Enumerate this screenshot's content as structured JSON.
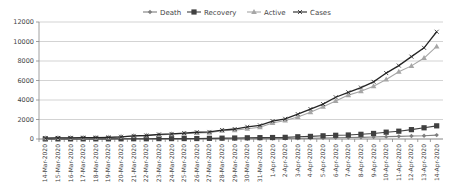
{
  "chart_data": {
    "type": "line",
    "title": "",
    "xlabel": "",
    "ylabel": "",
    "ylim": [
      0,
      12000
    ],
    "yticks": [
      0,
      2000,
      4000,
      6000,
      8000,
      10000,
      12000
    ],
    "grid": true,
    "legend_position": "top",
    "categories": [
      "14-Mar-2020",
      "15-Mar-2020",
      "16-Mar-2020",
      "17-Mar-2020",
      "18-Mar-2020",
      "19-Mar-2020",
      "20-Mar-2020",
      "21-Mar-2020",
      "22-Mar-2020",
      "23-Mar-2020",
      "24-Mar-2020",
      "25-Mar-2020",
      "26-Mar-2020",
      "27-Mar-2020",
      "28-Mar-2020",
      "29-Mar-2020",
      "30-Mar-2020",
      "31-Mar-2020",
      "1-Apr-2020",
      "2-Apr-2020",
      "3-Apr-2020",
      "4-Apr-2020",
      "5-Apr-2020",
      "6-Apr-2020",
      "7-Apr-2020",
      "8-Apr-2020",
      "9-Apr-2020",
      "10-Apr-2020",
      "11-Apr-2020",
      "12-Apr-2020",
      "13-Apr-2020",
      "14-Apr-2020"
    ],
    "series": [
      {
        "name": "Death",
        "color": "#7f7f7f",
        "marker": "diamond",
        "values": [
          2,
          2,
          2,
          3,
          3,
          4,
          4,
          7,
          7,
          10,
          10,
          13,
          17,
          20,
          25,
          27,
          32,
          35,
          41,
          56,
          75,
          83,
          109,
          124,
          149,
          169,
          199,
          239,
          273,
          308,
          339,
          400
        ]
      },
      {
        "name": "Recovery",
        "color": "#404040",
        "marker": "square",
        "values": [
          10,
          13,
          13,
          14,
          14,
          15,
          20,
          23,
          24,
          40,
          40,
          43,
          45,
          67,
          85,
          100,
          124,
          138,
          151,
          169,
          229,
          267,
          328,
          380,
          410,
          480,
          570,
          700,
          800,
          960,
          1150,
          1350
        ]
      },
      {
        "name": "Active",
        "color": "#a6a6a6",
        "marker": "triangle",
        "values": [
          70,
          90,
          100,
          120,
          140,
          160,
          220,
          300,
          370,
          420,
          480,
          540,
          620,
          650,
          850,
          900,
          1050,
          1200,
          1650,
          1900,
          2250,
          2750,
          3300,
          3900,
          4500,
          4900,
          5400,
          6100,
          6900,
          7500,
          8300,
          9500
        ]
      },
      {
        "name": "Cases",
        "color": "#262626",
        "marker": "x",
        "values": [
          82,
          107,
          114,
          137,
          151,
          173,
          223,
          315,
          360,
          468,
          519,
          606,
          694,
          724,
          918,
          1024,
          1251,
          1397,
          1834,
          2069,
          2547,
          3072,
          3577,
          4281,
          4789,
          5274,
          5865,
          6761,
          7529,
          8447,
          9352,
          11000
        ]
      }
    ]
  },
  "legend": [
    "Death",
    "Recovery",
    "Active",
    "Cases"
  ]
}
